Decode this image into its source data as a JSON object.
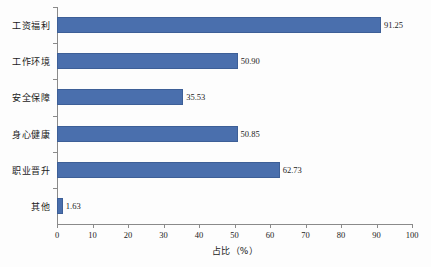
{
  "chart_data": {
    "type": "bar",
    "orientation": "horizontal",
    "title": "",
    "xlabel": "占比（%）",
    "ylabel": "",
    "categories": [
      "工资福利",
      "工作环境",
      "安全保障",
      "身心健康",
      "职业晋升",
      "其他"
    ],
    "values": [
      91.25,
      50.9,
      35.53,
      50.85,
      62.73,
      1.63
    ],
    "value_labels": [
      "91.25",
      "50.90",
      "35.53",
      "50.85",
      "62.73",
      "1.63"
    ],
    "xlim": [
      0,
      100
    ],
    "xticks": [
      0,
      10,
      20,
      30,
      40,
      50,
      60,
      70,
      80,
      90,
      100
    ],
    "xtick_labels": [
      "0",
      "10",
      "20",
      "30",
      "40",
      "50",
      "60",
      "70",
      "80",
      "90",
      "100"
    ],
    "grid": false,
    "legend": false,
    "series_color": "#4a6fad",
    "axis_color": "#8a8a8a",
    "background": "#fdfdfd"
  }
}
